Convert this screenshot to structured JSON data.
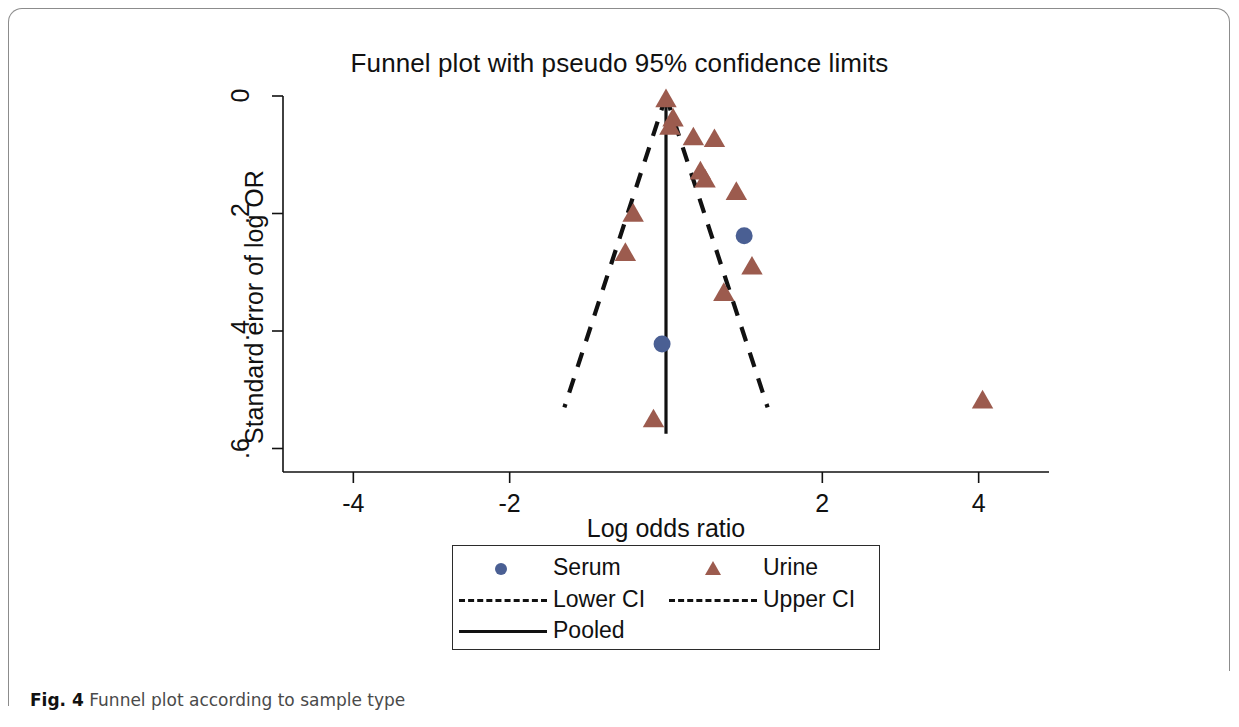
{
  "figure": {
    "caption_prefix": "Fig. 4",
    "caption_text": "Funnel plot according to sample type"
  },
  "chart_data": {
    "type": "scatter",
    "title": "Funnel plot with pseudo 95% confidence limits",
    "xlabel": "Log odds ratio",
    "ylabel": "Standard error of log OR",
    "xlim": [
      -4.9,
      4.9
    ],
    "ylim": [
      0.0,
      0.64
    ],
    "y_inverted": true,
    "grid": false,
    "xticks": [
      -4,
      -2,
      2,
      4
    ],
    "xtick_labels": [
      "-4",
      "-2",
      "2",
      "4"
    ],
    "yticks": [
      0,
      0.2,
      0.4,
      0.6
    ],
    "ytick_labels": [
      "0",
      ".2",
      ".4",
      ".6"
    ],
    "legend_position": "below-axes",
    "pooled_estimate": 0.0,
    "pooled_line": {
      "x": 0.0,
      "y_from": 0.0,
      "y_to": 0.575
    },
    "funnel_apex": {
      "x": 0.0,
      "y": 0.0
    },
    "funnel_half_width_at_base": 1.3,
    "funnel_base_y": 0.53,
    "series": [
      {
        "name": "Serum",
        "marker": "circle",
        "color": "#4a5f93",
        "points": [
          {
            "x": 1.0,
            "y": 0.238
          },
          {
            "x": -0.05,
            "y": 0.422
          }
        ]
      },
      {
        "name": "Urine",
        "marker": "triangle",
        "color": "#9c5b4e",
        "points": [
          {
            "x": 0.0,
            "y": 0.005
          },
          {
            "x": 0.09,
            "y": 0.038
          },
          {
            "x": 0.05,
            "y": 0.052
          },
          {
            "x": 0.35,
            "y": 0.07
          },
          {
            "x": 0.62,
            "y": 0.073
          },
          {
            "x": 0.44,
            "y": 0.128
          },
          {
            "x": 0.5,
            "y": 0.142
          },
          {
            "x": 0.9,
            "y": 0.163
          },
          {
            "x": -0.42,
            "y": 0.2
          },
          {
            "x": -0.52,
            "y": 0.267
          },
          {
            "x": 1.1,
            "y": 0.29
          },
          {
            "x": 0.74,
            "y": 0.335
          },
          {
            "x": -0.16,
            "y": 0.55
          },
          {
            "x": 4.05,
            "y": 0.518
          }
        ]
      }
    ],
    "legend": [
      {
        "label": "Serum",
        "key": "circle",
        "color": "#4a5f93"
      },
      {
        "label": "Urine",
        "key": "triangle",
        "color": "#9c5b4e"
      },
      {
        "label": "Lower CI",
        "key": "dashed",
        "color": "#111111"
      },
      {
        "label": "Upper CI",
        "key": "dashed",
        "color": "#111111"
      },
      {
        "label": "Pooled",
        "key": "solid",
        "color": "#111111"
      }
    ]
  }
}
